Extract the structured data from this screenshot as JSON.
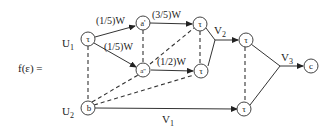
{
  "formula_label": "f(ε) =",
  "nodes": {
    "u1": {
      "label": "U",
      "sub": "1",
      "glyph": "τ"
    },
    "u2": {
      "label": "U",
      "sub": "2",
      "glyph": "b"
    },
    "a1": {
      "glyph": "a'"
    },
    "a2": {
      "glyph": "a''"
    },
    "t_top": {
      "glyph": "τ"
    },
    "t_mid": {
      "glyph": "τ"
    },
    "t_right": {
      "glyph": "τ"
    },
    "t_bottom": {
      "glyph": "τ"
    },
    "c": {
      "glyph": "c"
    }
  },
  "edges": {
    "u1_a1": "(1/5)W",
    "u1_a2": "(1/5)W",
    "a1_ttop": "(3/5)W",
    "a2_tmid": "(1/2)W",
    "v1": {
      "label": "V",
      "sub": "1"
    },
    "v2": {
      "label": "V",
      "sub": "2"
    },
    "v3": {
      "label": "V",
      "sub": "3"
    }
  }
}
